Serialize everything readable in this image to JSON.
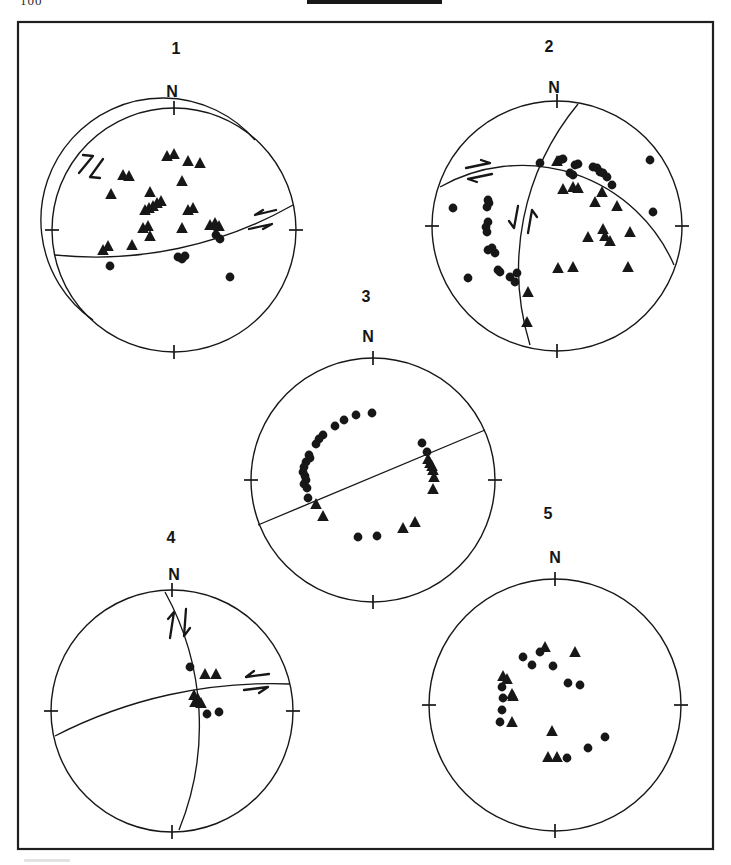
{
  "page": {
    "page_number": "100",
    "background": "#ffffff",
    "ink": "#171717",
    "frame": {
      "x": 18,
      "y": 22,
      "w": 695,
      "h": 827
    },
    "header_bar": {
      "x": 307,
      "y": 0,
      "w": 135,
      "h": 4
    },
    "caption_smudge": {
      "x": 24,
      "y": 859,
      "w": 46,
      "h": 3
    }
  },
  "chart_data": {
    "type": "scatter",
    "title": "",
    "marker_shapes": [
      "filled-triangle",
      "filled-circle"
    ],
    "stereonets": [
      {
        "label": "1",
        "north_label": "N",
        "cx": 174,
        "cy": 230,
        "r": 122,
        "label_pos": [
          176,
          54
        ],
        "n_pos": [
          172,
          97
        ],
        "great_circles": [
          "M 93 320 A 122 122 0 1 1 255 140",
          "M 55 255 A 400 400 0 0 0 293 205"
        ],
        "arrows": [
          {
            "shaft": [
              [
                79,
                173
              ],
              [
                93,
                156
              ]
            ],
            "barb": [
              [
                93,
                156
              ],
              [
                83,
                155
              ]
            ]
          },
          {
            "shaft": [
              [
                103,
                159
              ],
              [
                90,
                177
              ]
            ],
            "barb": [
              [
                90,
                177
              ],
              [
                100,
                178
              ]
            ]
          },
          {
            "shaft": [
              [
                276,
                210
              ],
              [
                255,
                215
              ]
            ],
            "barb": [
              [
                255,
                215
              ],
              [
                263,
                210
              ]
            ]
          },
          {
            "shaft": [
              [
                249,
                229
              ],
              [
                272,
                224
              ]
            ],
            "barb": [
              [
                272,
                224
              ],
              [
                263,
                229
              ]
            ]
          }
        ],
        "triangles": [
          [
            167,
            157
          ],
          [
            174,
            155
          ],
          [
            188,
            162
          ],
          [
            200,
            164
          ],
          [
            123,
            176
          ],
          [
            129,
            177
          ],
          [
            111,
            195
          ],
          [
            150,
            193
          ],
          [
            182,
            182
          ],
          [
            145,
            211
          ],
          [
            149,
            209
          ],
          [
            153,
            207
          ],
          [
            157,
            204
          ],
          [
            161,
            202
          ],
          [
            188,
            211
          ],
          [
            193,
            209
          ],
          [
            143,
            229
          ],
          [
            148,
            227
          ],
          [
            182,
            229
          ],
          [
            150,
            237
          ],
          [
            132,
            246
          ],
          [
            103,
            251
          ],
          [
            108,
            247
          ],
          [
            210,
            226
          ],
          [
            215,
            224
          ],
          [
            219,
            227
          ]
        ],
        "circles": [
          [
            216,
            235
          ],
          [
            220,
            239
          ],
          [
            178,
            257
          ],
          [
            182,
            259
          ],
          [
            185,
            256
          ],
          [
            110,
            266
          ],
          [
            230,
            277
          ]
        ]
      },
      {
        "label": "2",
        "north_label": "N",
        "cx": 557,
        "cy": 226,
        "r": 125,
        "label_pos": [
          549,
          52
        ],
        "n_pos": [
          554,
          93
        ],
        "great_circles": [
          "M 578 104 A 259 259 0 0 0 530 345",
          "M 440 187 A 166 166 0 0 1 674 265"
        ],
        "arrows": [
          {
            "shaft": [
              [
                466,
                168
              ],
              [
                490,
                163
              ]
            ],
            "barb": [
              [
                490,
                163
              ],
              [
                481,
                160
              ]
            ]
          },
          {
            "shaft": [
              [
                492,
                174
              ],
              [
                468,
                179
              ]
            ],
            "barb": [
              [
                468,
                179
              ],
              [
                477,
                182
              ]
            ]
          },
          {
            "shaft": [
              [
                518,
                206
              ],
              [
                514,
                228
              ]
            ],
            "barb": [
              [
                514,
                228
              ],
              [
                509,
                221
              ]
            ]
          },
          {
            "shaft": [
              [
                528,
                233
              ],
              [
                532,
                210
              ]
            ],
            "barb": [
              [
                532,
                210
              ],
              [
                537,
                217
              ]
            ]
          }
        ],
        "triangles": [
          [
            557,
            162
          ],
          [
            563,
            190
          ],
          [
            573,
            188
          ],
          [
            578,
            189
          ],
          [
            602,
            193
          ],
          [
            595,
            203
          ],
          [
            617,
            207
          ],
          [
            588,
            238
          ],
          [
            603,
            230
          ],
          [
            605,
            237
          ],
          [
            610,
            242
          ],
          [
            630,
            233
          ],
          [
            558,
            269
          ],
          [
            573,
            268
          ],
          [
            628,
            268
          ],
          [
            528,
            293
          ],
          [
            527,
            323
          ]
        ],
        "circles": [
          [
            540,
            163
          ],
          [
            560,
            160
          ],
          [
            563,
            159
          ],
          [
            575,
            165
          ],
          [
            578,
            164
          ],
          [
            570,
            173
          ],
          [
            573,
            175
          ],
          [
            593,
            167
          ],
          [
            597,
            168
          ],
          [
            600,
            172
          ],
          [
            603,
            173
          ],
          [
            607,
            177
          ],
          [
            612,
            185
          ],
          [
            650,
            160
          ],
          [
            453,
            208
          ],
          [
            488,
            200
          ],
          [
            489,
            203
          ],
          [
            487,
            207
          ],
          [
            488,
            222
          ],
          [
            486,
            227
          ],
          [
            487,
            232
          ],
          [
            488,
            250
          ],
          [
            492,
            248
          ],
          [
            495,
            253
          ],
          [
            498,
            270
          ],
          [
            500,
            272
          ],
          [
            510,
            277
          ],
          [
            515,
            282
          ],
          [
            517,
            273
          ],
          [
            468,
            278
          ],
          [
            653,
            212
          ]
        ]
      },
      {
        "label": "3",
        "north_label": "N",
        "cx": 373,
        "cy": 480,
        "r": 122,
        "label_pos": [
          366,
          302
        ],
        "n_pos": [
          368,
          342
        ],
        "great_circles": [
          "M 258 525 L 485 430"
        ],
        "arrows": [],
        "triangles": [
          [
            316,
            505
          ],
          [
            323,
            517
          ],
          [
            428,
            460
          ],
          [
            430,
            464
          ],
          [
            432,
            467
          ],
          [
            433,
            471
          ],
          [
            434,
            478
          ],
          [
            433,
            490
          ],
          [
            415,
            523
          ],
          [
            403,
            529
          ]
        ],
        "circles": [
          [
            372,
            413
          ],
          [
            356,
            415
          ],
          [
            344,
            420
          ],
          [
            335,
            426
          ],
          [
            323,
            435
          ],
          [
            319,
            439
          ],
          [
            316,
            444
          ],
          [
            309,
            455
          ],
          [
            310,
            458
          ],
          [
            306,
            462
          ],
          [
            304,
            467
          ],
          [
            303,
            472
          ],
          [
            305,
            476
          ],
          [
            306,
            480
          ],
          [
            304,
            484
          ],
          [
            307,
            488
          ],
          [
            308,
            498
          ],
          [
            422,
            443
          ],
          [
            427,
            452
          ],
          [
            358,
            537
          ],
          [
            377,
            536
          ]
        ]
      },
      {
        "label": "4",
        "north_label": "N",
        "cx": 172,
        "cy": 711,
        "r": 121,
        "label_pos": [
          171,
          543
        ],
        "n_pos": [
          174,
          580
        ],
        "great_circles": [
          "M 165 592 A 277 277 0 0 1 179 830",
          "M 55 736 A 472 472 0 0 1 290 684"
        ],
        "arrows": [
          {
            "shaft": [
              [
                170,
                638
              ],
              [
                174,
                612
              ]
            ],
            "barb": [
              [
                174,
                612
              ],
              [
                168,
                619
              ]
            ]
          },
          {
            "shaft": [
              [
                186,
                609
              ],
              [
                184,
                636
              ]
            ],
            "barb": [
              [
                184,
                636
              ],
              [
                190,
                628
              ]
            ]
          },
          {
            "shaft": [
              [
                269,
                674
              ],
              [
                246,
                677
              ]
            ],
            "barb": [
              [
                246,
                677
              ],
              [
                254,
                671
              ]
            ]
          },
          {
            "shaft": [
              [
                244,
                690
              ],
              [
                268,
                687
              ]
            ],
            "barb": [
              [
                268,
                687
              ],
              [
                259,
                693
              ]
            ]
          }
        ],
        "triangles": [
          [
            205,
            675
          ],
          [
            216,
            675
          ],
          [
            194,
            696
          ],
          [
            198,
            700
          ],
          [
            201,
            704
          ],
          [
            195,
            703
          ]
        ],
        "circles": [
          [
            190,
            667
          ],
          [
            207,
            714
          ],
          [
            219,
            712
          ]
        ]
      },
      {
        "label": "5",
        "north_label": "N",
        "cx": 555,
        "cy": 705,
        "r": 126,
        "label_pos": [
          548,
          519
        ],
        "n_pos": [
          555,
          563
        ],
        "great_circles": [],
        "arrows": [],
        "triangles": [
          [
            545,
            648
          ],
          [
            575,
            653
          ],
          [
            503,
            677
          ],
          [
            507,
            680
          ],
          [
            512,
            695
          ],
          [
            513,
            697
          ],
          [
            512,
            723
          ],
          [
            552,
            732
          ],
          [
            548,
            758
          ],
          [
            557,
            758
          ]
        ],
        "circles": [
          [
            523,
            657
          ],
          [
            532,
            665
          ],
          [
            540,
            652
          ],
          [
            553,
            666
          ],
          [
            568,
            683
          ],
          [
            580,
            685
          ],
          [
            502,
            687
          ],
          [
            503,
            698
          ],
          [
            502,
            710
          ],
          [
            500,
            722
          ],
          [
            588,
            748
          ],
          [
            605,
            737
          ],
          [
            567,
            758
          ]
        ]
      }
    ]
  }
}
